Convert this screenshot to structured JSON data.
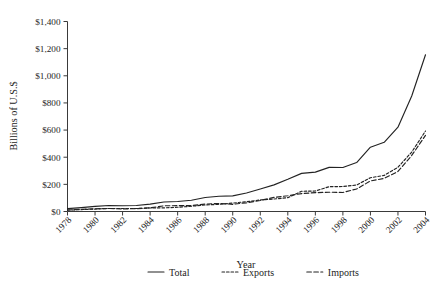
{
  "chart_data": {
    "type": "line",
    "title": "",
    "xlabel": "Year",
    "ylabel": "Billions of U.S.$",
    "xlim": [
      1978,
      2004
    ],
    "ylim": [
      0,
      1400
    ],
    "grid": false,
    "legend_position": "bottom",
    "x_tick_labels": [
      "1978",
      "1980",
      "1982",
      "1984",
      "1986",
      "1988",
      "1990",
      "1992",
      "1994",
      "1996",
      "1998",
      "2000",
      "2002",
      "2004"
    ],
    "y_tick_labels": [
      "$0",
      "$200",
      "$400",
      "$600",
      "$800",
      "$1,000",
      "$1,200",
      "$1,400"
    ],
    "y_tick_values": [
      0,
      200,
      400,
      600,
      800,
      1000,
      1200,
      1400
    ],
    "x": [
      1978,
      1979,
      1980,
      1981,
      1982,
      1983,
      1984,
      1985,
      1986,
      1987,
      1988,
      1989,
      1990,
      1991,
      1992,
      1993,
      1994,
      1995,
      1996,
      1997,
      1998,
      1999,
      2000,
      2001,
      2002,
      2003,
      2004
    ],
    "series": [
      {
        "name": "Total",
        "style": "solid",
        "values": [
          21,
          29,
          38,
          44,
          42,
          44,
          54,
          70,
          74,
          83,
          103,
          112,
          115,
          136,
          166,
          196,
          237,
          281,
          290,
          325,
          324,
          361,
          474,
          510,
          621,
          851,
          1155
        ]
      },
      {
        "name": "Exports",
        "style": "dotted",
        "values": [
          10,
          14,
          18,
          22,
          22,
          22,
          26,
          27,
          31,
          39,
          48,
          53,
          62,
          72,
          85,
          92,
          102,
          149,
          151,
          183,
          184,
          195,
          249,
          266,
          326,
          438,
          593
        ]
      },
      {
        "name": "Imports",
        "style": "dashed",
        "values": [
          11,
          16,
          20,
          22,
          19,
          21,
          27,
          42,
          43,
          43,
          55,
          59,
          53,
          64,
          81,
          104,
          116,
          132,
          139,
          142,
          140,
          166,
          225,
          244,
          295,
          413,
          561
        ]
      }
    ]
  },
  "legend": {
    "items": [
      {
        "label": "Total",
        "style": "solid"
      },
      {
        "label": "Exports",
        "style": "dotted"
      },
      {
        "label": "Imports",
        "style": "dashed"
      }
    ]
  },
  "colors": {
    "line": "#232323",
    "axis": "#3a3a3a",
    "background": "#ffffff",
    "text": "#1d1d1d"
  }
}
